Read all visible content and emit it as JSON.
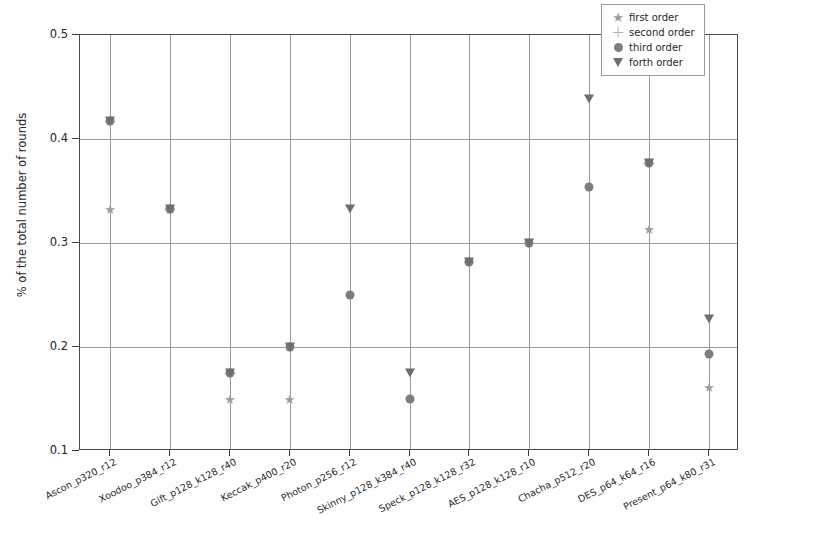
{
  "chart_data": {
    "type": "scatter",
    "title": "",
    "xlabel": "",
    "ylabel": "% of the total number of rounds",
    "ylim": [
      0.1,
      0.5
    ],
    "yticks": [
      "0.1",
      "0.2",
      "0.3",
      "0.4",
      "0.5"
    ],
    "ytick_values": [
      0.1,
      0.2,
      0.3,
      0.4,
      0.5
    ],
    "grid": true,
    "legend_position": "upper right",
    "categories": [
      "Ascon_p320_r12",
      "Xoodoo_p384_r12",
      "Gift_p128_k128_r40",
      "Keccak_p400_r20",
      "Photon_p256_r12",
      "Skinny_p128_k384_r40",
      "Speck_p128_k128_r32",
      "AES_p128_k128_r10",
      "Chacha_p512_r20",
      "DES_p64_k64_r16",
      "Present_p64_k80_r31"
    ],
    "series": [
      {
        "name": "first order",
        "marker": "star",
        "color": "#9d9d9d",
        "values": [
          0.333,
          0.333,
          0.15,
          0.15,
          null,
          null,
          null,
          null,
          null,
          0.313,
          0.162
        ]
      },
      {
        "name": "second order",
        "marker": "plus",
        "color": "#b4b4b4",
        "values": [
          0.417,
          0.333,
          0.175,
          0.2,
          null,
          null,
          0.282,
          0.3,
          null,
          0.377,
          null
        ]
      },
      {
        "name": "third order",
        "marker": "circle",
        "color": "#7d7d7d",
        "values": [
          0.417,
          0.333,
          0.175,
          0.2,
          0.25,
          0.15,
          0.282,
          0.3,
          0.354,
          0.377,
          0.193
        ]
      },
      {
        "name": "forth order",
        "marker": "triangle-down",
        "color": "#6e6e6e",
        "values": [
          0.417,
          0.333,
          0.175,
          0.2,
          0.333,
          0.175,
          0.282,
          0.3,
          0.438,
          0.377,
          0.227
        ]
      }
    ]
  },
  "legend": {
    "entries": [
      {
        "label": "first order",
        "marker": "star"
      },
      {
        "label": "second order",
        "marker": "plus"
      },
      {
        "label": "third order",
        "marker": "circle"
      },
      {
        "label": "forth order",
        "marker": "triangle-down"
      }
    ]
  }
}
